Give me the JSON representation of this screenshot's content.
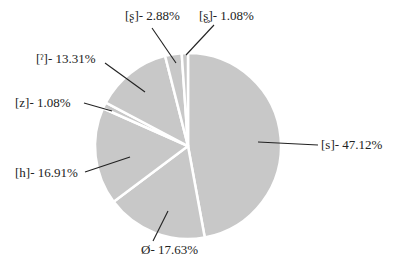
{
  "chart_data": {
    "type": "pie",
    "title": "",
    "start_angle_deg": 0,
    "direction": "clockwise",
    "slice_color": "#c8c8c8",
    "separator_color": "#ffffff",
    "slices": [
      {
        "label": "[s]",
        "value": 47.12,
        "text": "[s]- 47.12%"
      },
      {
        "label": "Ø",
        "value": 17.63,
        "text": "Ø- 17.63%"
      },
      {
        "label": "[h]",
        "value": 16.91,
        "text": "[h]- 16.91%"
      },
      {
        "label": "[z]",
        "value": 1.08,
        "text": "[z]- 1.08%"
      },
      {
        "label": "[ˀ]",
        "value": 13.31,
        "text": "[ˀ]- 13.31%"
      },
      {
        "label": "[ʂ]",
        "value": 2.88,
        "text": "[ʂ]- 2.88%"
      },
      {
        "label": "[ʂ̥]",
        "value": 1.08,
        "text": "[ʂ̥]- 1.08%"
      }
    ],
    "legend": "none"
  },
  "labels": {
    "s": "[s]- 47.12%",
    "null": "Ø- 17.63%",
    "h": "[h]- 16.91%",
    "z": "[z]- 1.08%",
    "glottal": "[ˀ]- 13.31%",
    "retroflex": "[ʂ]- 2.88%",
    "retroflex_voiceless": "[ʂ̥]- 1.08%"
  }
}
